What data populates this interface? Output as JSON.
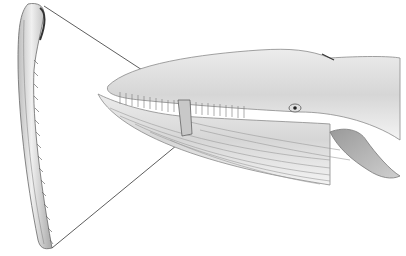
{
  "image": {
    "subject": "Illustration of a baleen whale head with an enlarged single baleen plate",
    "style": "grayscale pencil illustration on white background",
    "elements": [
      {
        "name": "baleen-plate",
        "description": "Long curved baleen plate with fringed inner edge, shown on the left"
      },
      {
        "name": "whale-head",
        "description": "Whale head with open mouth showing baleen rows, eye, throat grooves and pectoral fin"
      },
      {
        "name": "connector-lines",
        "description": "Two thin lines linking the baleen plate to its position in the mouth"
      }
    ]
  },
  "colors": {
    "background": "#ffffff",
    "body_light": "#e6e6e6",
    "body_mid": "#bdbdbd",
    "body_dark": "#7a7a7a",
    "line": "#333333"
  }
}
